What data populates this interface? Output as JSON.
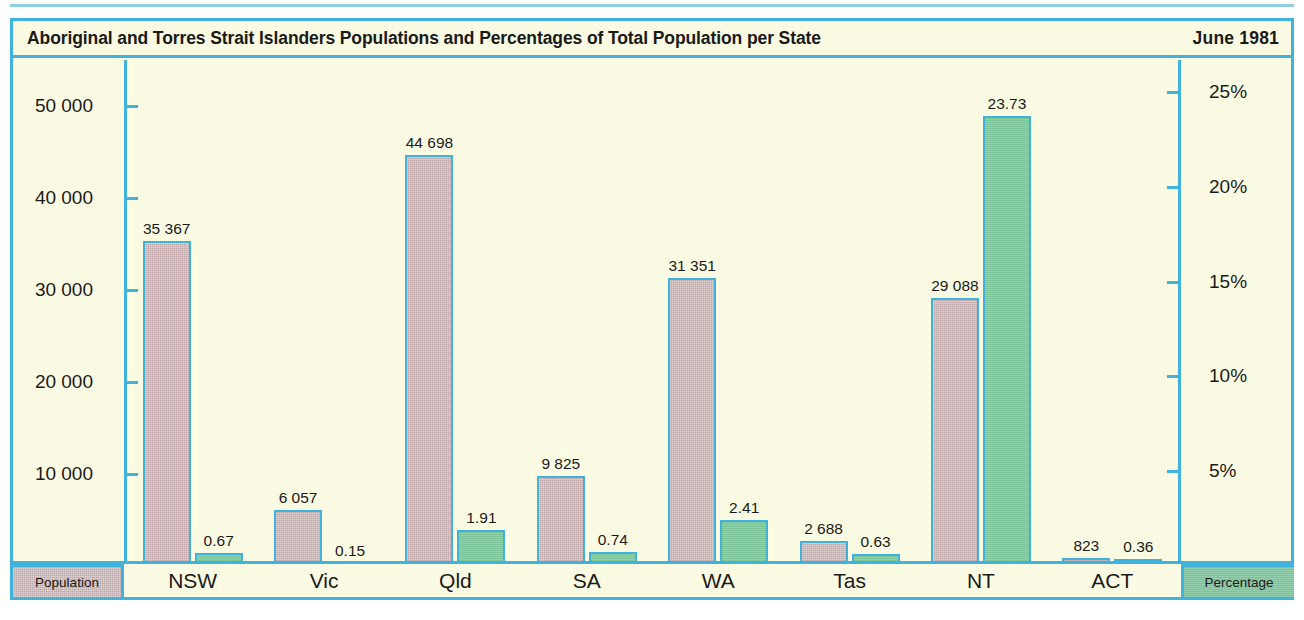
{
  "figure": {
    "title": "Aboriginal and Torres Strait Islanders Populations and Percentages of Total Population per State",
    "date": "June 1981",
    "legend_population": "Population",
    "legend_percentage": "Percentage"
  },
  "colors": {
    "border": "#3fb3dc",
    "background": "#fbfbe3",
    "population_bar": "#c0a8aa",
    "percentage_bar": "#7cc49a",
    "text": "#1a1a1a"
  },
  "chart_data": {
    "type": "bar",
    "title": "Aboriginal and Torres Strait Islanders Populations and Percentages of Total Population per State",
    "subtitle": "June 1981",
    "xlabel": "",
    "ylabel": "",
    "grid": false,
    "legend_position": "bottom-corners",
    "categories": [
      "NSW",
      "Vic",
      "Qld",
      "SA",
      "WA",
      "Tas",
      "NT",
      "ACT"
    ],
    "axes": {
      "left": {
        "name": "Population",
        "ylim": [
          0,
          55000
        ],
        "ticks": [
          10000,
          20000,
          30000,
          40000,
          50000
        ],
        "tick_labels": [
          "10 000",
          "20 000",
          "30 000",
          "40 000",
          "50 000"
        ]
      },
      "right": {
        "name": "Percentage",
        "ylim": [
          0,
          26.7
        ],
        "ticks": [
          5,
          10,
          15,
          20,
          25
        ],
        "tick_labels": [
          "5%",
          "10%",
          "15%",
          "20%",
          "25%"
        ]
      }
    },
    "series": [
      {
        "name": "Population",
        "axis": "left",
        "color": "#c0a8aa",
        "values": [
          35367,
          6057,
          44698,
          9825,
          31351,
          2688,
          29088,
          823
        ],
        "data_labels": [
          "35 367",
          "6 057",
          "44 698",
          "9 825",
          "31 351",
          "2 688",
          "29 088",
          "823"
        ]
      },
      {
        "name": "Percentage",
        "axis": "right",
        "color": "#7cc49a",
        "values": [
          0.67,
          0.15,
          1.91,
          0.74,
          2.41,
          0.63,
          23.73,
          0.36
        ],
        "data_labels": [
          "0.67",
          "0.15",
          "1.91",
          "0.74",
          "2.41",
          "0.63",
          "23.73",
          "0.36"
        ]
      }
    ]
  }
}
